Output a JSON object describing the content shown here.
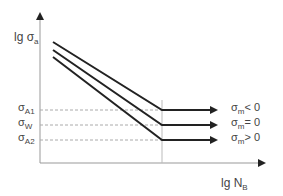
{
  "diagram": {
    "type": "S-N curve (Woehler diagram) with mean stress effect",
    "y_axis": {
      "label_main": "lg σ",
      "label_sub": "a"
    },
    "x_axis": {
      "label_main": "lg N",
      "label_sub": "B"
    },
    "levels": [
      {
        "symbol": "σ",
        "sub": "A1",
        "condition_sym": "σ",
        "condition_sub": "m",
        "condition_rel": "< 0"
      },
      {
        "symbol": "σ",
        "sub": "W",
        "condition_sym": "σ",
        "condition_sub": "m",
        "condition_rel": "= 0"
      },
      {
        "symbol": "σ",
        "sub": "A2",
        "condition_sym": "σ",
        "condition_sub": "m",
        "condition_rel": "> 0"
      }
    ],
    "colors": {
      "curve": "#222222",
      "axis": "#888888",
      "dashed": "#aaaaaa"
    }
  }
}
